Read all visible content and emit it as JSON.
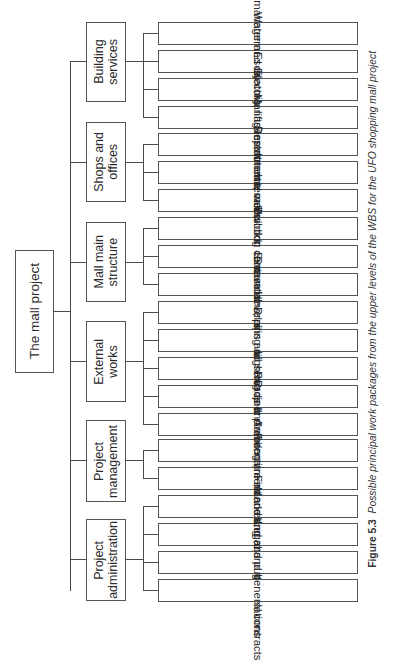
{
  "root": {
    "label": "The mall project"
  },
  "branches": [
    {
      "label": "Building\nservices",
      "items": [
        "Building management systems",
        "Water and drainage",
        "Electrics",
        "Escalators, lifts and hoists"
      ]
    },
    {
      "label": "Shops and\noffices",
      "items": [
        "Management offices",
        "Department stores",
        "Restaurants, cafes and shops"
      ]
    },
    {
      "label": "Mall main\nstructure",
      "items": [
        "Internal works: common areas",
        "Internal works: central concourse",
        "Building carcase above ground"
      ]
    },
    {
      "label": "External\nworks",
      "items": [
        "Ground level surfacing",
        "Excavations, piling and foundations",
        "Drains and service ducts",
        "Lighting and signs",
        "Roads and walkways"
      ]
    },
    {
      "label": "Project\nmanagement",
      "items": [
        "Project planning and control",
        "Architecture and design"
      ]
    },
    {
      "label": "Project\nadministration",
      "items": [
        "Recruitment and employment",
        "Finance and accounting",
        "Marketing and public relations",
        "Legal and general contracts"
      ]
    }
  ],
  "caption": {
    "number": "Figure 5.3",
    "text": "Possible principal work packages from the upper levels of the WBS for the UFO shopping mall project"
  }
}
